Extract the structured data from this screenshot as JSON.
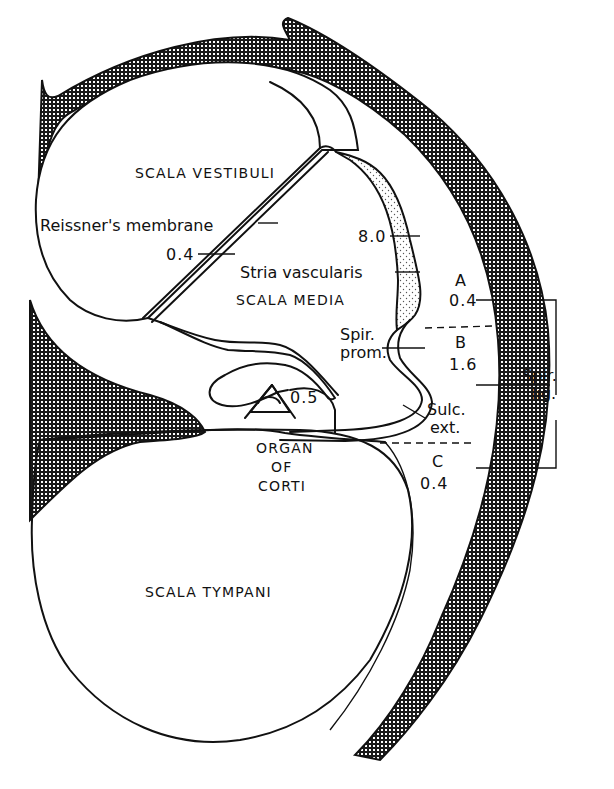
{
  "diagram": {
    "type": "anatomical cross-section",
    "colors": {
      "ink": "#111111",
      "background": "#ffffff",
      "bone_hatch": "#1a1a1a",
      "stria_stipple": "#555555"
    },
    "compartments": {
      "scala_vestibuli": "SCALA VESTIBULI",
      "scala_media": "SCALA MEDIA",
      "scala_tympani": "SCALA TYMPANI",
      "organ_of_corti": {
        "line1": "ORGAN",
        "line2": "OF",
        "line3": "CORTI"
      }
    },
    "structures": {
      "reissners_membrane": {
        "label": "Reissner's membrane",
        "value": "0.4"
      },
      "stria_vascularis": {
        "label": "Stria vascularis",
        "value": "8.0"
      },
      "spiral_prominence": {
        "line1": "Spir.",
        "line2": "prom."
      },
      "sulcus_externus": {
        "line1": "Sulc.",
        "line2": "ext."
      },
      "organ_value": "0.5",
      "spiral_ligament": {
        "line1": "Spir.",
        "line2": "lig."
      }
    },
    "ligament_regions": [
      {
        "letter": "A",
        "value": "0.4"
      },
      {
        "letter": "B",
        "value": "1.6"
      },
      {
        "letter": "C",
        "value": "0.4"
      }
    ]
  }
}
